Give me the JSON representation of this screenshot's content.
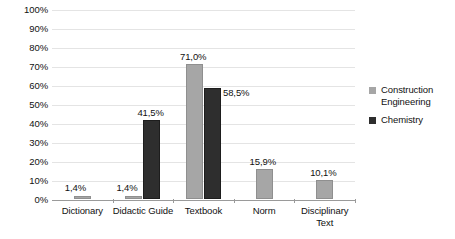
{
  "chart_data": {
    "type": "bar",
    "title": "",
    "xlabel": "",
    "ylabel": "",
    "ylim": [
      0,
      100
    ],
    "grid": true,
    "legend_position": "right",
    "categories": [
      "Dictionary",
      "Didactic Guide",
      "Textbook",
      "Norm",
      "Disciplinary\nText"
    ],
    "ytick_labels": [
      "100%",
      "90%",
      "80%",
      "70%",
      "60%",
      "50%",
      "40%",
      "30%",
      "20%",
      "10%",
      "0%"
    ],
    "ytick_values": [
      100,
      90,
      80,
      70,
      60,
      50,
      40,
      30,
      20,
      10,
      0
    ],
    "series": [
      {
        "name": "Construction Engineering",
        "color": "#a6a6a6",
        "values": [
          1.4,
          1.4,
          71.0,
          15.9,
          10.1
        ],
        "labels": [
          "1,4%",
          "1,4%",
          "71,0%",
          "15,9%",
          "10,1%"
        ]
      },
      {
        "name": "Chemistry",
        "color": "#2e2e2e",
        "values": [
          null,
          41.5,
          58.5,
          null,
          null
        ],
        "labels": [
          null,
          "41,5%",
          "58,5%",
          null,
          null
        ]
      }
    ]
  },
  "legend": {
    "items": [
      {
        "label": "Construction Engineering",
        "swatch": "#a6a6a6"
      },
      {
        "label": "Chemistry",
        "swatch": "#2e2e2e"
      }
    ]
  }
}
